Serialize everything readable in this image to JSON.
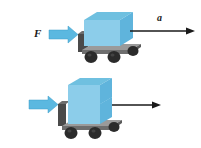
{
  "figure": {
    "background_color": "#ffffff",
    "line_color": "#1a1a1a"
  },
  "palette": {
    "box_front": "#8ccdea",
    "box_top": "#6fc0e0",
    "box_side": "#5fb4dc",
    "force_arrow": "#5bb8e0",
    "force_arrow_edge": "#3d9ecb",
    "chassis_top": "#9a9a9a",
    "chassis_front": "#6e6e6e",
    "chassis_dark": "#4a4a4a",
    "wheel": "#2b2b2b",
    "wheel_highlight": "#585858"
  },
  "panels": [
    {
      "id": "top",
      "name": "single-mass-cart-panel",
      "force_label": "F",
      "accel_label": "a",
      "accel_is_fraction": false,
      "box_count": 1,
      "description": "Cart with one box pushed by force F, accelerating at a"
    },
    {
      "id": "bottom",
      "name": "double-mass-cart-panel",
      "force_label": "F",
      "accel_numerator": "a",
      "accel_denominator": "2",
      "accel_is_fraction": true,
      "box_count": 2,
      "description": "Cart with two stacked boxes pushed by same force F, accelerating at a/2"
    }
  ]
}
